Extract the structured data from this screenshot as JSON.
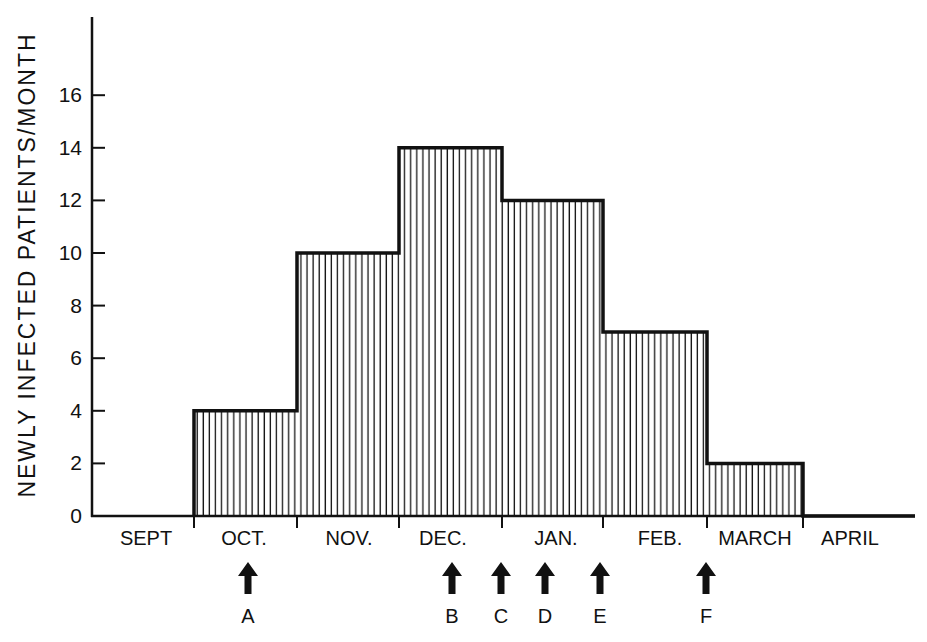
{
  "chart_data": {
    "type": "bar",
    "style": "step-histogram with vertical hatching",
    "title": "",
    "xlabel": "",
    "ylabel": "NEWLY INFECTED PATIENTS/MONTH",
    "categories": [
      "SEPT",
      "OCT.",
      "NOV.",
      "DEC.",
      "JAN.",
      "FEB.",
      "MARCH",
      "APRIL"
    ],
    "values": [
      0,
      4,
      10,
      14,
      12,
      7,
      2,
      0
    ],
    "ylim": [
      0,
      18
    ],
    "yticks": [
      0,
      2,
      4,
      6,
      8,
      10,
      12,
      14,
      16
    ],
    "grid": false,
    "legend": null,
    "annotations": [
      {
        "label": "A",
        "month": "OCT.",
        "symbol": "up-arrow"
      },
      {
        "label": "B",
        "month": "DEC.",
        "symbol": "up-arrow"
      },
      {
        "label": "C",
        "month": "DEC./JAN. boundary",
        "symbol": "up-arrow"
      },
      {
        "label": "D",
        "month": "JAN.",
        "symbol": "up-arrow"
      },
      {
        "label": "E",
        "month": "JAN./FEB. boundary",
        "symbol": "up-arrow"
      },
      {
        "label": "F",
        "month": "FEB./MARCH boundary",
        "symbol": "up-arrow"
      }
    ]
  },
  "axis": {
    "ylabel": "NEWLY INFECTED PATIENTS/MONTH",
    "yticks": [
      "0",
      "2",
      "4",
      "6",
      "8",
      "10",
      "12",
      "14",
      "16"
    ]
  },
  "months": [
    "SEPT",
    "OCT.",
    "NOV.",
    "DEC.",
    "JAN.",
    "FEB.",
    "MARCH",
    "APRIL"
  ],
  "markers": [
    "A",
    "B",
    "C",
    "D",
    "E",
    "F"
  ],
  "colors": {
    "ink": "#111111",
    "background": "#ffffff"
  }
}
